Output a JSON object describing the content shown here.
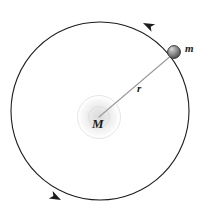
{
  "figure": {
    "type": "orbital-mechanics-diagram",
    "background_color": "#ffffff",
    "width": 211,
    "height": 223,
    "labels": {
      "central_mass": "M",
      "orbiting_mass": "m",
      "radius": "r"
    },
    "orbit": {
      "center_x": 100,
      "center_y": 111,
      "radius": 89,
      "stroke_color": "#1c1c1c",
      "stroke_width": 1.1,
      "direction": "counterclockwise",
      "fill": "none"
    },
    "central_body": {
      "x": 99,
      "y": 117,
      "glow_outer_radius": 22,
      "glow_inner_radius": 10,
      "glow_color": "#e8e8e8",
      "label_color": "#1a1a1a"
    },
    "orbiting_body": {
      "x": 174,
      "y": 52,
      "radius": 6.5,
      "fill_light": "#c9c9c9",
      "fill_dark": "#555555",
      "stroke_color": "#3a3a3a"
    },
    "radius_line": {
      "x1": 99,
      "x2": 169,
      "y1": 117,
      "y2": 57,
      "stroke_color": "#9a9a9a",
      "stroke_width": 1.1
    },
    "arrow_top": {
      "x": 143,
      "y": 23,
      "rotation_deg": 206,
      "fill": "#1c1c1c"
    },
    "arrow_bottom": {
      "x": 61,
      "y": 200,
      "rotation_deg": 27,
      "fill": "#1c1c1c"
    }
  }
}
